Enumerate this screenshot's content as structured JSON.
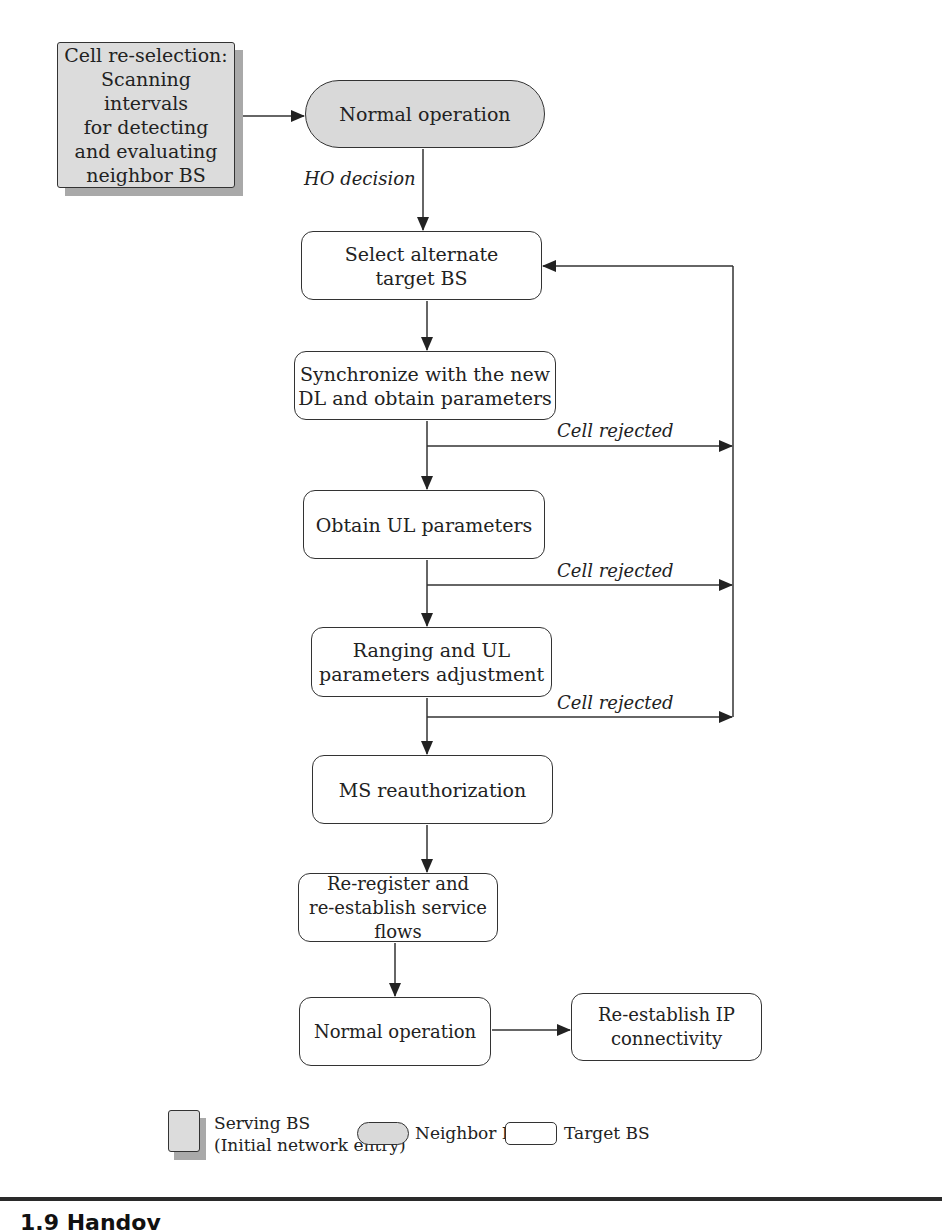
{
  "diagram": {
    "type": "flowchart",
    "nodes": {
      "serving": {
        "text": "Cell re-selection: Scanning intervals for detecting and evaluating neighbor BS",
        "lines": [
          "Cell re-selection:",
          "Scanning intervals",
          "for detecting",
          "and evaluating",
          "neighbor BS"
        ],
        "kind": "serving"
      },
      "normal_top": {
        "text": "Normal operation",
        "kind": "neighbor"
      },
      "select": {
        "lines": [
          "Select alternate",
          "target BS"
        ],
        "kind": "target"
      },
      "sync": {
        "lines": [
          "Synchronize with the new",
          "DL and obtain parameters"
        ],
        "kind": "target"
      },
      "obtain_ul": {
        "text": "Obtain UL parameters",
        "kind": "target"
      },
      "ranging": {
        "lines": [
          "Ranging and UL",
          "parameters adjustment"
        ],
        "kind": "target"
      },
      "reauth": {
        "text": "MS reauthorization",
        "kind": "target"
      },
      "reregister": {
        "lines": [
          "Re-register and",
          "re-establish service flows"
        ],
        "kind": "target"
      },
      "normal_bottom": {
        "text": "Normal operation",
        "kind": "target"
      },
      "reestablish_ip": {
        "lines": [
          "Re-establish IP",
          "connectivity"
        ],
        "kind": "target"
      }
    },
    "edge_labels": {
      "ho_decision": "HO decision",
      "cell_rejected_1": "Cell rejected",
      "cell_rejected_2": "Cell rejected",
      "cell_rejected_3": "Cell rejected"
    },
    "edges": [
      [
        "serving",
        "normal_top"
      ],
      [
        "normal_top",
        "select",
        "HO decision"
      ],
      [
        "select",
        "sync"
      ],
      [
        "sync",
        "obtain_ul"
      ],
      [
        "sync",
        "select",
        "Cell rejected"
      ],
      [
        "obtain_ul",
        "ranging"
      ],
      [
        "obtain_ul",
        "select",
        "Cell rejected"
      ],
      [
        "ranging",
        "reauth"
      ],
      [
        "ranging",
        "select",
        "Cell rejected"
      ],
      [
        "reauth",
        "reregister"
      ],
      [
        "reregister",
        "normal_bottom"
      ],
      [
        "normal_bottom",
        "reestablish_ip"
      ]
    ]
  },
  "legend": {
    "serving": {
      "line1": "Serving BS",
      "line2": "(Initial network entry)"
    },
    "neighbor": {
      "label": "Neighbor BS"
    },
    "target": {
      "label": "Target BS"
    }
  },
  "caption": {
    "text": "1.9   Handov"
  },
  "colors": {
    "gray_fill": "#d9d9d9",
    "shadow": "#a9a9a9",
    "stroke": "#333333"
  }
}
